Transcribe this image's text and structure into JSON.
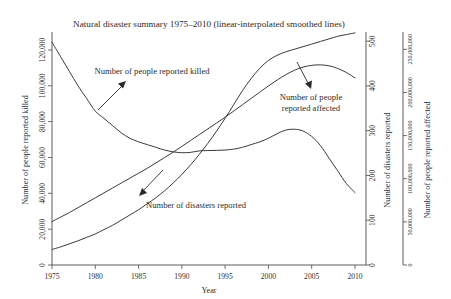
{
  "chart_data": {
    "type": "line",
    "title": "Natural disaster summary 1975–2010 (linear-interpolated smoothed lines)",
    "xlabel": "Year",
    "x": [
      1975,
      1976,
      1977,
      1978,
      1979,
      1980,
      1981,
      1982,
      1983,
      1984,
      1985,
      1986,
      1987,
      1988,
      1989,
      1990,
      1991,
      1992,
      1993,
      1994,
      1995,
      1996,
      1997,
      1998,
      1999,
      2000,
      2001,
      2002,
      2003,
      2004,
      2005,
      2006,
      2007,
      2008,
      2009,
      2010
    ],
    "xlim": [
      1975,
      2010
    ],
    "xticks": [
      1975,
      1980,
      1985,
      1990,
      1995,
      2000,
      2005,
      2010
    ],
    "xticklabels": [
      "1975",
      "1980",
      "1985",
      "1990",
      "1995",
      "2000",
      "2005",
      "2010"
    ],
    "grid": false,
    "legend": "none (in-plot annotations with arrows)",
    "axes": [
      {
        "id": "left",
        "position": "left",
        "label": "Number of people reported killed",
        "lim": [
          0,
          130000
        ],
        "ticks": [
          0,
          20000,
          40000,
          60000,
          80000,
          100000,
          120000
        ],
        "ticklabels": [
          "0",
          "20,000",
          "40,000",
          "60,000",
          "80,000",
          "100,000",
          "120,000"
        ]
      },
      {
        "id": "right_inner",
        "position": "right",
        "label": "Number of disasters reported",
        "lim": [
          0,
          520
        ],
        "ticks": [
          0,
          100,
          200,
          300,
          400,
          500
        ],
        "ticklabels": [
          "0",
          "100",
          "200",
          "300",
          "400",
          "500"
        ]
      },
      {
        "id": "right_outer",
        "position": "right-outer",
        "label": "Number of people reported affected",
        "lim": [
          0,
          270000000
        ],
        "ticks": [
          0,
          50000000,
          100000000,
          150000000,
          200000000,
          250000000
        ],
        "ticklabels": [
          "0",
          "50,000,000",
          "100,000,000",
          "150,000,000",
          "200,000,000",
          "250,000,000"
        ]
      }
    ],
    "series": [
      {
        "name": "Number of people reported killed",
        "axis": "left",
        "units": "people killed",
        "values": [
          123000,
          115000,
          107000,
          99000,
          92000,
          85000,
          81000,
          77000,
          73000,
          70000,
          68000,
          66500,
          65000,
          63500,
          62500,
          62000,
          62200,
          63000,
          63200,
          63300,
          63500,
          64000,
          65000,
          66500,
          68000,
          70000,
          72500,
          74500,
          75000,
          74000,
          71000,
          66000,
          59000,
          52000,
          45000,
          40000
        ]
      },
      {
        "name": "Number of disasters reported",
        "axis": "right_inner",
        "units": "disasters",
        "values": [
          97,
          107,
          117,
          128,
          139,
          150,
          161,
          172,
          183,
          194,
          205,
          216,
          228,
          240,
          252,
          265,
          278,
          291,
          304,
          317,
          330,
          344,
          358,
          372,
          386,
          400,
          413,
          425,
          435,
          442,
          446,
          447,
          445,
          439,
          430,
          418
        ]
      },
      {
        "name": "Number of people reported affected",
        "axis": "right_outer",
        "units": "people affected",
        "values": [
          18000000,
          21000000,
          24500000,
          28000000,
          32000000,
          36000000,
          41000000,
          46000000,
          52000000,
          58000000,
          64000000,
          71000000,
          78000000,
          86000000,
          95000000,
          105000000,
          116000000,
          128000000,
          141000000,
          155000000,
          170000000,
          186000000,
          202000000,
          216000000,
          228000000,
          237000000,
          243000000,
          247000000,
          250000000,
          253000000,
          256000000,
          259000000,
          262000000,
          265000000,
          267000000,
          269000000
        ]
      }
    ],
    "annotations": [
      {
        "id": "annot-killed",
        "text": "Number of people reported killed",
        "points_to_series": "Number of people reported killed"
      },
      {
        "id": "annot-affected",
        "text_line1": "Number of people",
        "text_line2": "reported affected",
        "points_to_series": "Number of people reported affected"
      },
      {
        "id": "annot-disasters",
        "text": "Number of disasters reported",
        "points_to_series": "Number of disasters reported"
      }
    ]
  },
  "colors": {
    "background": "#ffffff",
    "line": "#3a3a3a",
    "axis": "#4a4a4a",
    "text": "#2b2b2b"
  }
}
